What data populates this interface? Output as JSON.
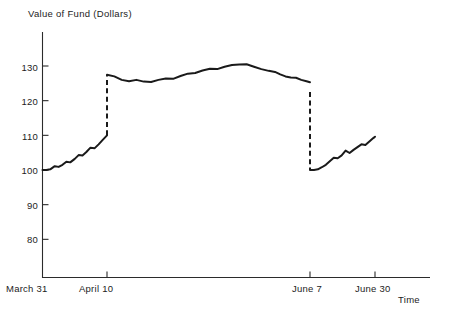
{
  "chart_data": {
    "type": "line",
    "title": "Value of Fund (Dollars)",
    "xlabel": "Time",
    "ylabel": "Value of Fund (Dollars)",
    "ylim": [
      75,
      134
    ],
    "yticks": [
      80,
      90,
      100,
      110,
      120,
      130
    ],
    "ytick_labels": [
      "80",
      "90",
      "100",
      "110",
      "120",
      "130"
    ],
    "xticks": [
      "March 31",
      "April 10",
      "June 7",
      "June 30"
    ],
    "xtick_labels": [
      "March 31",
      "April 10",
      "June 7",
      "June 30"
    ],
    "grid": false,
    "legend": "none",
    "discontinuities": [
      {
        "at": "April 10",
        "from": 110.0,
        "to": 127.5,
        "style": "dashed"
      },
      {
        "at": "June 7",
        "from": 122.5,
        "to": 100.0,
        "style": "dashed"
      }
    ],
    "segments": [
      {
        "name": "March 31 to April 10",
        "start_label": "March 31",
        "end_label": "April 10",
        "x": [
          0.0,
          0.6,
          1.2,
          1.9,
          2.5,
          3.1,
          3.7,
          4.3,
          5.0,
          5.6,
          6.2,
          6.8,
          7.4,
          8.1,
          8.7,
          9.3,
          10.0
        ],
        "values": [
          100.0,
          100.0,
          100.2,
          101.1,
          100.9,
          101.5,
          102.4,
          102.2,
          103.2,
          104.3,
          104.2,
          105.2,
          106.4,
          106.3,
          107.4,
          108.6,
          110.0
        ]
      },
      {
        "name": "April 10 to June 7",
        "start_label": "April 10",
        "end_label": "June 7",
        "x": [
          10.0,
          12.1,
          14.2,
          16.3,
          18.4,
          20.5,
          22.6,
          24.7,
          26.8,
          28.9,
          31.0,
          33.1,
          35.2,
          37.3,
          39.4,
          41.5,
          43.6,
          45.7,
          47.8,
          49.9,
          52.0,
          54.1,
          56.2,
          58.0
        ],
        "values": [
          127.5,
          127.0,
          126.0,
          125.6,
          126.0,
          125.5,
          125.4,
          126.0,
          126.4,
          126.3,
          127.1,
          127.8,
          128.0,
          128.7,
          129.2,
          129.1,
          129.8,
          130.3,
          130.4,
          130.5,
          129.8,
          129.1,
          128.6,
          128.3
        ]
      },
      {
        "name": "decline to June 7",
        "start_label": "mid-May",
        "end_label": "June 7",
        "x": [
          58.0,
          59.5,
          61.0,
          62.5,
          64.0,
          65.5,
          67.0,
          68.0
        ],
        "values": [
          128.3,
          127.6,
          127.0,
          126.7,
          126.6,
          126.0,
          125.6,
          125.3
        ]
      },
      {
        "name": "June 7 to June 30",
        "start_label": "June 7",
        "end_label": "June 30",
        "x": [
          68.0,
          69.4,
          70.8,
          72.2,
          73.6,
          75.0,
          76.4,
          77.8,
          79.2,
          80.6,
          82.0,
          83.4,
          84.8,
          86.2,
          87.6,
          89.0,
          90.4,
          91.0
        ],
        "values": [
          100.0,
          100.0,
          100.2,
          100.8,
          101.5,
          102.5,
          103.5,
          103.4,
          104.2,
          105.6,
          104.9,
          105.8,
          106.6,
          107.4,
          107.2,
          108.2,
          109.2,
          109.6
        ]
      }
    ]
  },
  "axis": {
    "y_title": "Value of Fund (Dollars)",
    "x_title": "Time"
  }
}
